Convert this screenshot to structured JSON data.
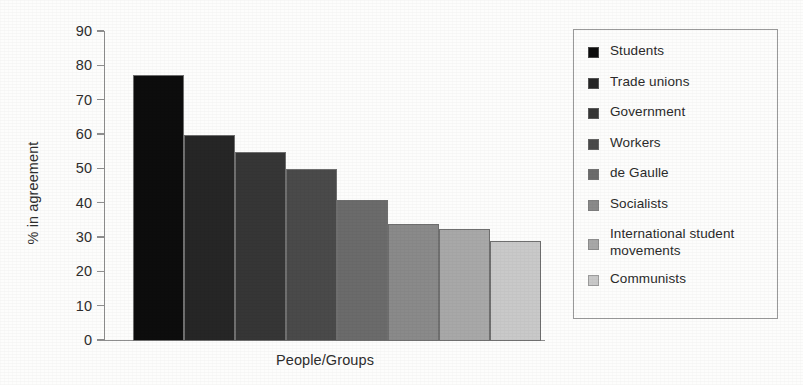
{
  "chart_data": {
    "type": "bar",
    "title": "",
    "xlabel": "People/Groups",
    "ylabel": "% in agreement",
    "ylim": [
      0,
      90
    ],
    "yticks": [
      0,
      10,
      20,
      30,
      40,
      50,
      60,
      70,
      80,
      90
    ],
    "grid": false,
    "legend_position": "right",
    "categories": [
      "Students",
      "Trade unions",
      "Government",
      "Workers",
      "de Gaulle",
      "Socialists",
      "International student movements",
      "Communists"
    ],
    "values": [
      77.5,
      60,
      55,
      50,
      41,
      34,
      32.5,
      29
    ],
    "colors": [
      "#0d0d0d",
      "#262626",
      "#363636",
      "#4a4a4a",
      "#6b6b6b",
      "#8a8a8a",
      "#a8a8a8",
      "#c9c9c9"
    ]
  },
  "legend": {
    "items": [
      {
        "label": "Students",
        "color": "#0d0d0d"
      },
      {
        "label": "Trade unions",
        "color": "#262626"
      },
      {
        "label": "Government",
        "color": "#363636"
      },
      {
        "label": "Workers",
        "color": "#4a4a4a"
      },
      {
        "label": "de Gaulle",
        "color": "#6b6b6b"
      },
      {
        "label": "Socialists",
        "color": "#8a8a8a"
      },
      {
        "label": "International student movements",
        "color": "#a8a8a8"
      },
      {
        "label": "Communists",
        "color": "#c9c9c9"
      }
    ]
  }
}
